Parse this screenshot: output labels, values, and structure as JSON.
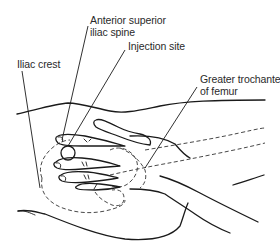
{
  "figure": {
    "labels": [
      {
        "id": "asis",
        "lines": [
          "Anterior superior",
          "iliac spine"
        ]
      },
      {
        "id": "injection",
        "lines": [
          "Injection site"
        ]
      },
      {
        "id": "crest",
        "lines": [
          "Iliac crest"
        ]
      },
      {
        "id": "trochanter",
        "lines": [
          "Greater trochanter",
          "of femur"
        ]
      }
    ],
    "colors": {
      "background": "#ffffff",
      "ink": "#1a1a1a",
      "text": "#2a2a2a"
    }
  }
}
